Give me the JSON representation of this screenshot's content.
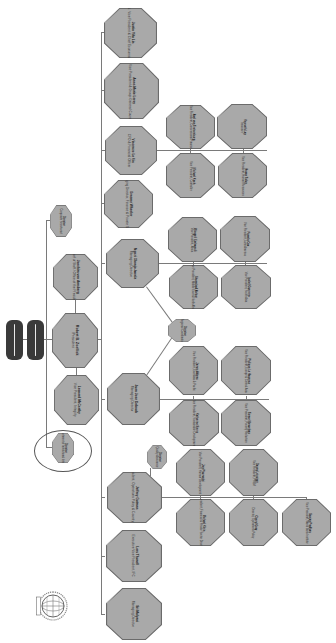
{
  "chart": {
    "orientation": "rotated-90"
  },
  "boards": [
    {
      "label": "Board of Governors"
    },
    {
      "label": "Board of Executive Directors"
    }
  ],
  "president": {
    "name": "Robert B. Zoellick",
    "title": "President"
  },
  "top_level": [
    {
      "name": "Director",
      "title": "Corporate Secretariat"
    },
    {
      "name": "Joachim von Amsberg",
      "title": "Chief of Staff / Office of the President"
    },
    {
      "name": "Leonard McCarthy",
      "title": "Vice President, Integrity"
    },
    {
      "name": "Director",
      "title": "Independent Evaluation Group"
    }
  ],
  "managing": [
    {
      "name": "Justin Yifu Lin",
      "title": "Sr. Vice President & Chief Economist"
    },
    {
      "name": "Anne-Marie Leroy",
      "title": "Sr. Vice President & Group General Counsel"
    },
    {
      "name": "Vincenzo La Via",
      "title": "CFO & Financial Officer"
    },
    {
      "name": "Graeme Wheeler",
      "title": "Managing Director, Finance & Private Sector"
    },
    {
      "name": "Ngozi Okonjo-Iweala",
      "title": "Managing Director"
    },
    {
      "name": "Juan Jose Daboub",
      "title": "Managing Director"
    },
    {
      "name": "Jeffrey Gutman",
      "title": "Vice President, Operations Policy & Country Services"
    },
    {
      "name": "Lars Thunell",
      "title": "Executive Vice President, IFC"
    },
    {
      "name": "Sri Mulyani",
      "title": "Managing Director"
    }
  ],
  "finance_reports": [
    {
      "name": "Axel van Trotsenburg",
      "title": "Vice President, Concessional Finance"
    },
    {
      "name": "Kenneth Lay",
      "title": "Treasurer"
    },
    {
      "name": "Michael Koch",
      "title": "Vice President, Controller"
    },
    {
      "name": "Hasan Tuluy",
      "title": "Vice President, Human Resources"
    }
  ],
  "ngozi_reports": [
    {
      "name": "Obiageli Ezekwesili",
      "title": "Vice President, Africa"
    },
    {
      "name": "Pamela Cox",
      "title": "Vice President, Latin America"
    },
    {
      "name": "Shamshad Akhtar",
      "title": "Vice President, Middle East & North Africa"
    },
    {
      "name": "Isabel Guerrero",
      "title": "Vice President, South Asia"
    }
  ],
  "shared_small": {
    "name": "Director",
    "title": "Regional Coordination"
  },
  "daboub_reports": [
    {
      "name": "James Adams",
      "title": "Vice President, East Asia & Pacific"
    },
    {
      "name": "Philippe Le Houerou",
      "title": "Vice President, Europe & Central Asia"
    },
    {
      "name": "Katherine Sierra",
      "title": "Vice President, Sustainable Development"
    },
    {
      "name": "Tamar Manuelyan",
      "title": "Vice President, Poverty Reduction"
    }
  ],
  "gutman_small": {
    "name": "Director",
    "title": "Quality Assurance"
  },
  "gutman_reports": [
    {
      "name": "Joy Phumaphi",
      "title": "Vice President, Human Development"
    },
    {
      "name": "Danny Leipziger",
      "title": "Vice President, PREM"
    },
    {
      "name": "Michael Klein",
      "title": "Vice President, Financial & Private Sector Development"
    },
    {
      "name": "Cheryl Gray",
      "title": "Director, Operations Policy"
    },
    {
      "name": "Sanjay Pradhan",
      "title": "Vice President, World Bank Institute"
    }
  ],
  "highlight": {
    "name": "Director",
    "title": "Department of Institutional Integrity",
    "circled": true
  },
  "logo": {
    "label": "WORLD BANK",
    "icon": "globe-icon"
  },
  "colors": {
    "node_fill": "#a9a9a9",
    "node_border": "#6b6b6b",
    "board_fill": "#3a3a3a",
    "line": "#7a7a7a",
    "background": "#ffffff"
  }
}
